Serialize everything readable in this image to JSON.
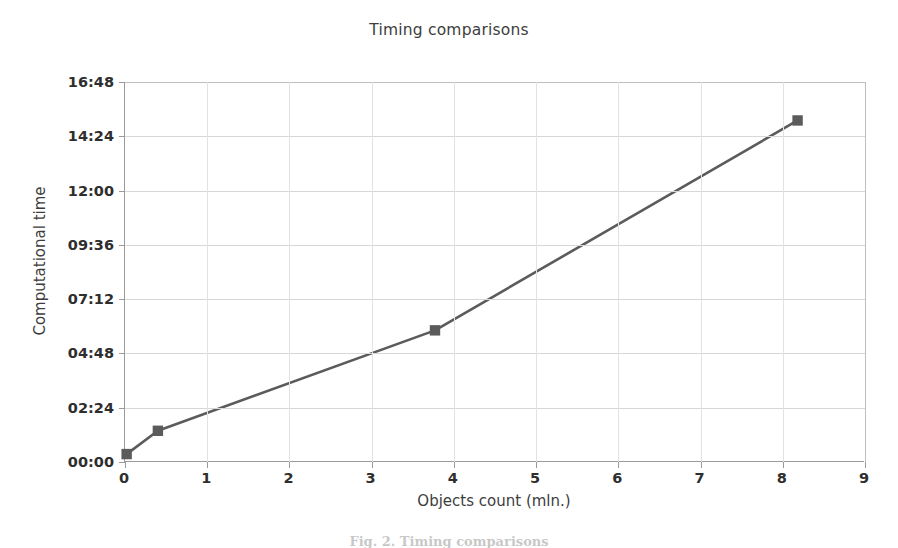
{
  "chart_data": {
    "type": "line",
    "title": "Timing comparisons",
    "xlabel": "Objects count (mln.)",
    "ylabel": "Computational time",
    "x": [
      0.02,
      0.4,
      3.77,
      8.18
    ],
    "y_labels": [
      "00:21",
      "01:23",
      "05:49",
      "15:06"
    ],
    "y_minutes": [
      0.35,
      1.38,
      5.82,
      15.1
    ],
    "series": [
      {
        "name": "Computational time",
        "x": [
          0.02,
          0.4,
          3.77,
          8.18
        ],
        "values": [
          0.35,
          1.38,
          5.82,
          15.1
        ]
      }
    ],
    "xlim": [
      0,
      9
    ],
    "ylim": [
      0,
      16.8
    ],
    "xticks": [
      0,
      1,
      2,
      3,
      4,
      5,
      6,
      7,
      8,
      9
    ],
    "xtick_labels": [
      "0",
      "1",
      "2",
      "3",
      "4",
      "5",
      "6",
      "7",
      "8",
      "9"
    ],
    "yticks": [
      0,
      2.4,
      4.8,
      7.2,
      9.6,
      12.0,
      14.4,
      16.8
    ],
    "ytick_labels": [
      "00:00",
      "02:24",
      "04:48",
      "07:12",
      "09:36",
      "12:00",
      "14:24",
      "16:48"
    ],
    "grid": true,
    "grid_axis": "both",
    "legend": "none",
    "marker": "square",
    "line_color": "#5b5b5b",
    "marker_color": "#5b5b5b",
    "grid_color": "#d7d7d7",
    "axis_color": "#9a9a9a",
    "text_color": "#2e2e2e"
  },
  "caption": {
    "text": "Fig. 2. Timing comparisons"
  }
}
